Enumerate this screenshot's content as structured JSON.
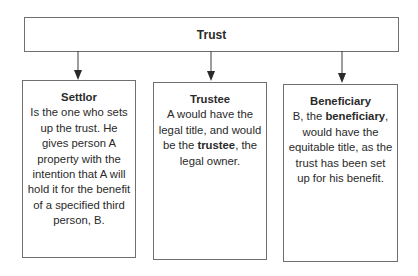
{
  "diagram": {
    "root": {
      "title": "Trust"
    },
    "children": [
      {
        "id": "settlor",
        "title": "Settlor",
        "body_parts": [
          {
            "text": "Is the one who sets up the trust. He gives person A property with the intention that A will hold it for the benefit of a specified third person, B.",
            "bold": false
          }
        ]
      },
      {
        "id": "trustee",
        "title": "Trustee",
        "body_parts": [
          {
            "text": "A would have the legal title, and would be the ",
            "bold": false
          },
          {
            "text": "trustee",
            "bold": true
          },
          {
            "text": ", the legal owner.",
            "bold": false
          }
        ]
      },
      {
        "id": "beneficiary",
        "title": "Beneficiary",
        "body_parts": [
          {
            "text": "B, the ",
            "bold": false
          },
          {
            "text": "beneficiary",
            "bold": true
          },
          {
            "text": ", would have the equitable title, as the trust has been set up for his benefit.",
            "bold": false
          }
        ]
      }
    ],
    "colors": {
      "border": "#6f6f6f",
      "text": "#2a2a2a",
      "arrow": "#3a3a3a",
      "background": "#ffffff"
    }
  }
}
